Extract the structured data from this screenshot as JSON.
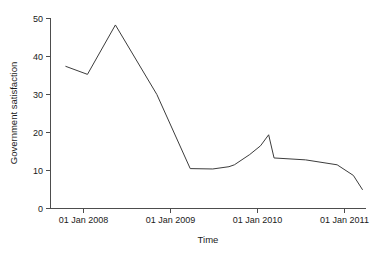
{
  "chart_data": {
    "type": "line",
    "title": "",
    "xlabel": "Time",
    "ylabel": "Government satisfaction",
    "grid": false,
    "legend": "none",
    "xlim": [
      2007.62,
      2011.12
    ],
    "ylim": [
      0,
      50
    ],
    "x_tick_labels": [
      "01 Jan 2008",
      "01 Jan 2009",
      "01 Jan 2010",
      "01 Jan 2011"
    ],
    "x_tick_values": [
      2008.0,
      2009.0,
      2010.0,
      2011.0
    ],
    "y_tick_labels": [
      "0",
      "10",
      "20",
      "30",
      "40",
      "50"
    ],
    "y_tick_values": [
      0,
      10,
      20,
      30,
      40,
      50
    ],
    "series": [
      {
        "name": "Government satisfaction",
        "color": "#3c3c3c",
        "x": [
          2007.79,
          2008.03,
          2008.34,
          2008.8,
          2009.17,
          2009.42,
          2009.6,
          2009.66,
          2009.83,
          2009.95,
          2010.04,
          2010.1,
          2010.45,
          2010.8,
          2010.98,
          2011.08
        ],
        "values": [
          37.4,
          35.3,
          48.3,
          30.0,
          10.5,
          10.4,
          11.0,
          11.5,
          14.2,
          16.5,
          19.4,
          13.3,
          12.8,
          11.5,
          8.7,
          5.0
        ]
      }
    ]
  },
  "axes": {
    "y_axis_title": "Government satisfaction",
    "x_axis_title": "Time"
  }
}
